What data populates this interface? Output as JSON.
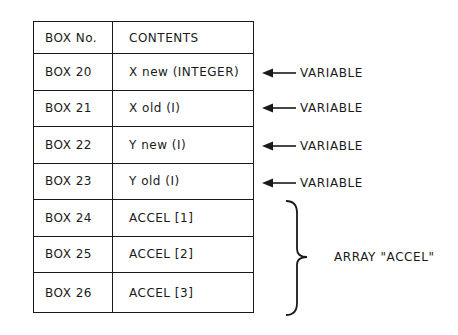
{
  "table": {
    "headers": {
      "box_no": "BOX No.",
      "contents": "CONTENTS"
    },
    "rows": [
      {
        "box_no": "BOX 20",
        "contents": "X new (INTEGER)"
      },
      {
        "box_no": "BOX 21",
        "contents": "X old (I)"
      },
      {
        "box_no": "BOX 22",
        "contents": "Y new (I)"
      },
      {
        "box_no": "BOX 23",
        "contents": "Y old (I)"
      },
      {
        "box_no": "BOX 24",
        "contents": "ACCEL [1]"
      },
      {
        "box_no": "BOX 25",
        "contents": "ACCEL [2]"
      },
      {
        "box_no": "BOX 26",
        "contents": "ACCEL [3]"
      }
    ]
  },
  "annotations": {
    "variables": [
      {
        "label": "VARIABLE",
        "points_to": "BOX 20"
      },
      {
        "label": "VARIABLE",
        "points_to": "BOX 21"
      },
      {
        "label": "VARIABLE",
        "points_to": "BOX 22"
      },
      {
        "label": "VARIABLE",
        "points_to": "BOX 23"
      }
    ],
    "array": {
      "label": "ARRAY \"ACCEL\"",
      "spans": [
        "BOX 24",
        "BOX 25",
        "BOX 26"
      ]
    },
    "icons": {
      "arrow": "left-arrow-icon",
      "brace": "right-curly-brace-icon"
    }
  },
  "colors": {
    "line": "#1a1a1a",
    "background": "#ffffff"
  }
}
